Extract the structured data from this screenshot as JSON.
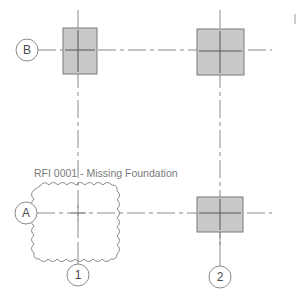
{
  "grids": {
    "rows": [
      {
        "label": "B",
        "y": 50,
        "bubble_x": 27
      },
      {
        "label": "A",
        "y": 213,
        "bubble_x": 26
      }
    ],
    "columns": [
      {
        "label": "1",
        "x": 78,
        "bubble_y": 275
      },
      {
        "label": "2",
        "x": 220,
        "bubble_y": 277
      }
    ]
  },
  "columns_present": [
    {
      "grid": "B-1",
      "x": 63,
      "y": 28,
      "w": 34,
      "h": 46
    },
    {
      "grid": "B-2",
      "x": 197,
      "y": 29,
      "w": 47,
      "h": 46
    },
    {
      "grid": "A-2",
      "x": 197,
      "y": 197,
      "w": 46,
      "h": 35
    }
  ],
  "rfi": {
    "label": "RFI 0001 - Missing Foundation",
    "cloud": {
      "x": 37,
      "y": 181,
      "w": 84,
      "h": 73
    }
  },
  "colors": {
    "grid_line": "#8a8a8a",
    "column_fill": "#c9c9c9",
    "column_stroke": "#7a7a7a",
    "text": "#7a7a7a"
  }
}
